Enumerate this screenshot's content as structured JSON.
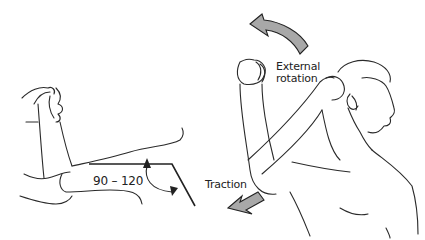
{
  "figure": {
    "left_panel": {
      "angle_label": "90 – 120",
      "description": "Arm flexed at elbow with angle indicator"
    },
    "right_panel": {
      "rotation_label_line1": "External",
      "rotation_label_line2": "rotation",
      "traction_label": "Traction",
      "description": "Man with arm raised, hand behind head"
    },
    "colors": {
      "arrow_fill": "#a8a8a8",
      "line": "#222222",
      "background": "#ffffff"
    }
  }
}
